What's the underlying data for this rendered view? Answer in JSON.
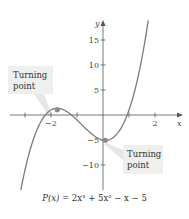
{
  "chart_data": {
    "type": "line",
    "title": "",
    "function": "P(x) = 2x^3 + 5x^2 - x - 5",
    "xlabel": "x",
    "ylabel": "y",
    "xlim": [
      -3.8,
      3.2
    ],
    "ylim": [
      -14,
      19
    ],
    "x_ticks": [
      -3,
      -2,
      -1,
      1,
      2
    ],
    "x_tick_labels": [
      {
        "value": -2,
        "label": "−2"
      },
      {
        "value": 2,
        "label": "2"
      }
    ],
    "y_ticks": [
      -10,
      -5,
      5,
      10,
      15
    ],
    "y_tick_labels": [
      {
        "value": 15,
        "label": "15"
      },
      {
        "value": 10,
        "label": "10"
      },
      {
        "value": 5,
        "label": "5"
      },
      {
        "value": -5,
        "label": "−5"
      },
      {
        "value": -10,
        "label": "−10"
      }
    ],
    "grid": false,
    "series": [
      {
        "name": "P(x)",
        "color": "#7a7a7a"
      }
    ],
    "points": [
      {
        "name": "Turning point",
        "x": -1.76,
        "y": 1.05
      },
      {
        "name": "Turning point",
        "x": 0.09,
        "y": -5.05
      }
    ],
    "annotations": [
      {
        "text_line1": "Turning",
        "text_line2": "point",
        "target": "local-max"
      },
      {
        "text_line1": "Turning",
        "text_line2": "point",
        "target": "local-min"
      }
    ]
  },
  "formula": {
    "lhs": "P(x)",
    "rhs": "= 2x³ + 5x² − x − 5"
  },
  "colors": {
    "curve": "#7a7a7a",
    "axis": "#555555",
    "point": "#8a8a8a",
    "callout_bg": "#efefef",
    "callout_tail": "#e4e4e4"
  }
}
